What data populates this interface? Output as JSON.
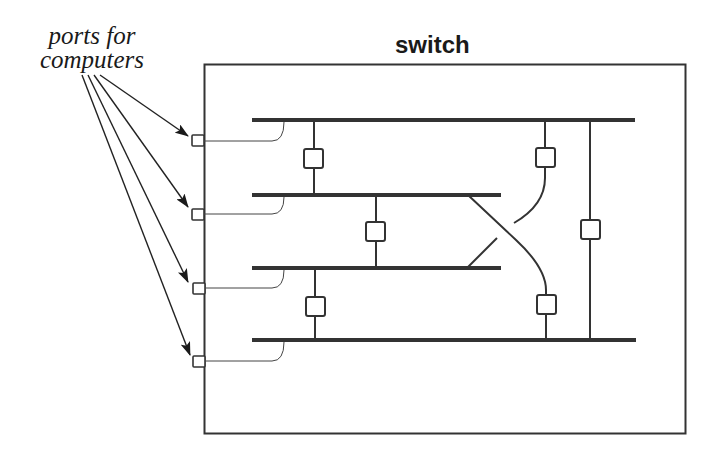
{
  "diagram": {
    "title": "switch",
    "annotation": {
      "line1": "ports for",
      "line2": "computers"
    },
    "colors": {
      "stroke": "#333333",
      "background": "#ffffff"
    },
    "ports": [
      {
        "id": "port-1",
        "y": 140
      },
      {
        "id": "port-2",
        "y": 214
      },
      {
        "id": "port-3",
        "y": 288
      },
      {
        "id": "port-4",
        "y": 361
      }
    ],
    "buses": [
      {
        "id": "bus-1",
        "y": 120,
        "x1": 252,
        "x2": 635
      },
      {
        "id": "bus-2",
        "y": 195,
        "x1": 252,
        "x2": 500
      },
      {
        "id": "bus-3",
        "y": 268,
        "x1": 252,
        "x2": 500
      },
      {
        "id": "bus-4",
        "y": 340,
        "x1": 252,
        "x2": 635
      }
    ],
    "bridges": [
      {
        "id": "bridge-bus1-bus2",
        "connects": [
          "bus-1",
          "bus-2"
        ]
      },
      {
        "id": "bridge-bus2-bus3",
        "connects": [
          "bus-2",
          "bus-3"
        ]
      },
      {
        "id": "bridge-bus3-bus4",
        "connects": [
          "bus-3",
          "bus-4"
        ]
      },
      {
        "id": "bridge-bus1-bus3-crossing",
        "connects": [
          "bus-1",
          "bus-3"
        ]
      },
      {
        "id": "bridge-bus2-bus4-crossing",
        "connects": [
          "bus-2",
          "bus-4"
        ]
      },
      {
        "id": "bridge-bus1-bus4",
        "connects": [
          "bus-1",
          "bus-4"
        ]
      }
    ]
  }
}
